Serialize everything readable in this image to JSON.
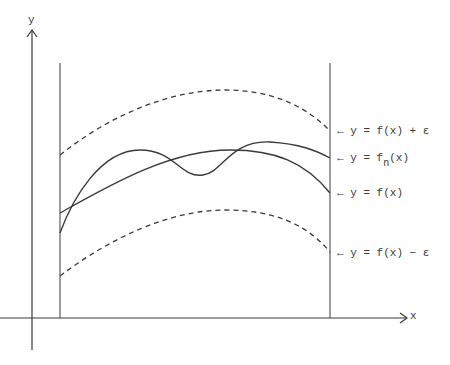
{
  "axes": {
    "x_label": "x",
    "y_label": "y"
  },
  "curves": [
    {
      "id": "upper-bound",
      "label_prefix": "← y = ",
      "label_main": "f(x) + ε",
      "style": "dashed"
    },
    {
      "id": "approximation",
      "label_prefix": "← y = ",
      "label_f": "f",
      "label_sub": "n",
      "label_suffix": "(x)",
      "style": "solid"
    },
    {
      "id": "function",
      "label_prefix": "← y = ",
      "label_main": "f(x)",
      "style": "solid"
    },
    {
      "id": "lower-bound",
      "label_prefix": "← y = ",
      "label_main": "f(x) − ε",
      "style": "dashed"
    }
  ],
  "colors": {
    "ink": "#3a3a3a",
    "background": "#ffffff"
  }
}
